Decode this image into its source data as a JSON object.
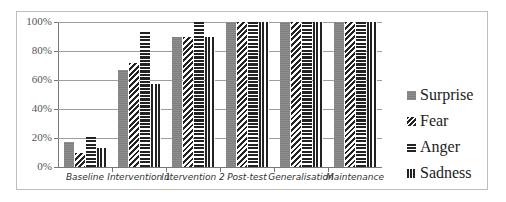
{
  "chart_data": {
    "type": "bar",
    "title": "",
    "xlabel": "",
    "ylabel": "",
    "ylim": [
      0,
      100
    ],
    "yticks": [
      "0%",
      "20%",
      "40%",
      "60%",
      "80%",
      "100%"
    ],
    "grid": true,
    "legend_position": "right",
    "categories": [
      "Baseline",
      "Intervention 1",
      "Intervention 2",
      "Post-test",
      "Generalisation",
      "Maintenance"
    ],
    "series": [
      {
        "name": "Surprise",
        "pattern": "solid-grey",
        "values": [
          17,
          67,
          90,
          100,
          100,
          100
        ]
      },
      {
        "name": "Fear",
        "pattern": "diagonal-stripes",
        "values": [
          10,
          72,
          90,
          100,
          100,
          100
        ]
      },
      {
        "name": "Anger",
        "pattern": "horizontal-stripes",
        "values": [
          22,
          94,
          100,
          100,
          100,
          100
        ]
      },
      {
        "name": "Sadness",
        "pattern": "vertical-stripes",
        "values": [
          13,
          57,
          90,
          100,
          100,
          100
        ]
      }
    ]
  },
  "colors": {
    "surprise": "#7f7f7f",
    "pattern_ink": "#222222",
    "grid": "#9e9e9e"
  }
}
